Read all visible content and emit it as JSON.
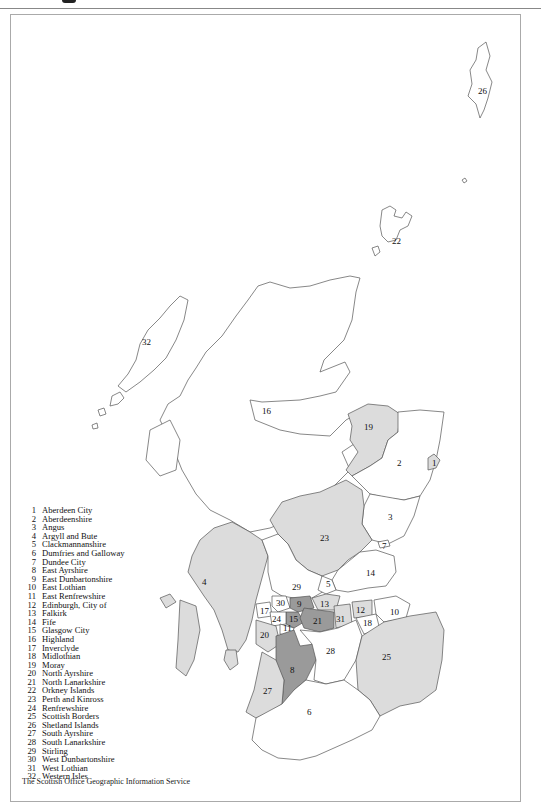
{
  "map": {
    "title_hidden": "",
    "fill_colors": {
      "white": "#ffffff",
      "light": "#dcdcdc",
      "dark": "#9a9a9a",
      "outline": "#555555"
    },
    "region_labels": [
      {
        "id": "1",
        "x": 432,
        "y": 466
      },
      {
        "id": "2",
        "x": 397,
        "y": 466
      },
      {
        "id": "3",
        "x": 390,
        "y": 517
      },
      {
        "id": "4",
        "x": 205,
        "y": 583
      },
      {
        "id": "5",
        "x": 328,
        "y": 584
      },
      {
        "id": "6",
        "x": 310,
        "y": 713
      },
      {
        "id": "7",
        "x": 384,
        "y": 546
      },
      {
        "id": "8",
        "x": 293,
        "y": 672
      },
      {
        "id": "9",
        "x": 300,
        "y": 603
      },
      {
        "id": "10",
        "x": 394,
        "y": 613
      },
      {
        "id": "11",
        "x": 289,
        "y": 626
      },
      {
        "id": "12",
        "x": 362,
        "y": 609
      },
      {
        "id": "13",
        "x": 325,
        "y": 604
      },
      {
        "id": "14",
        "x": 372,
        "y": 573
      },
      {
        "id": "15",
        "x": 295,
        "y": 617
      },
      {
        "id": "16",
        "x": 266,
        "y": 412
      },
      {
        "id": "17",
        "x": 265,
        "y": 611
      },
      {
        "id": "18",
        "x": 369,
        "y": 623
      },
      {
        "id": "19",
        "x": 370,
        "y": 427
      },
      {
        "id": "20",
        "x": 265,
        "y": 635
      },
      {
        "id": "21",
        "x": 317,
        "y": 621
      },
      {
        "id": "23",
        "x": 325,
        "y": 538
      },
      {
        "id": "22",
        "x": 397,
        "y": 242
      },
      {
        "id": "24",
        "x": 276,
        "y": 618
      },
      {
        "id": "25",
        "x": 387,
        "y": 658
      },
      {
        "id": "26",
        "x": 482,
        "y": 91
      },
      {
        "id": "27",
        "x": 268,
        "y": 691
      },
      {
        "id": "28",
        "x": 329,
        "y": 652
      },
      {
        "id": "29",
        "x": 296,
        "y": 587
      },
      {
        "id": "30",
        "x": 280,
        "y": 603
      },
      {
        "id": "31",
        "x": 340,
        "y": 619
      },
      {
        "id": "32",
        "x": 146,
        "y": 343
      }
    ]
  },
  "legend": {
    "items": [
      {
        "num": "1",
        "name": "Aberdeen City"
      },
      {
        "num": "2",
        "name": "Aberdeenshire"
      },
      {
        "num": "3",
        "name": "Angus"
      },
      {
        "num": "4",
        "name": "Argyll and Bute"
      },
      {
        "num": "5",
        "name": "Clackmannanshire"
      },
      {
        "num": "6",
        "name": "Dumfries and Galloway"
      },
      {
        "num": "7",
        "name": "Dundee City"
      },
      {
        "num": "8",
        "name": "East Ayrshire"
      },
      {
        "num": "9",
        "name": "East Dunbartonshire"
      },
      {
        "num": "10",
        "name": "East Lothian"
      },
      {
        "num": "11",
        "name": "East Renfrewshire"
      },
      {
        "num": "12",
        "name": "Edinburgh, City of"
      },
      {
        "num": "13",
        "name": "Falkirk"
      },
      {
        "num": "14",
        "name": "Fife"
      },
      {
        "num": "15",
        "name": "Glasgow City"
      },
      {
        "num": "16",
        "name": "Highland"
      },
      {
        "num": "17",
        "name": "Inverclyde"
      },
      {
        "num": "18",
        "name": "Midlothian"
      },
      {
        "num": "19",
        "name": "Moray"
      },
      {
        "num": "20",
        "name": "North Ayrshire"
      },
      {
        "num": "21",
        "name": "North Lanarkshire"
      },
      {
        "num": "22",
        "name": "Orkney Islands"
      },
      {
        "num": "23",
        "name": "Perth and Kinross"
      },
      {
        "num": "24",
        "name": "Renfrewshire"
      },
      {
        "num": "25",
        "name": "Scottish Borders"
      },
      {
        "num": "26",
        "name": "Shetland Islands"
      },
      {
        "num": "27",
        "name": "South Ayrshire"
      },
      {
        "num": "28",
        "name": "South Lanarkshire"
      },
      {
        "num": "29",
        "name": "Stirling"
      },
      {
        "num": "30",
        "name": "West Dunbartonshire"
      },
      {
        "num": "31",
        "name": "West Lothian"
      },
      {
        "num": "32",
        "name": "Western Isles"
      }
    ]
  },
  "credit": "The Scottish Office Geographic Information Service"
}
